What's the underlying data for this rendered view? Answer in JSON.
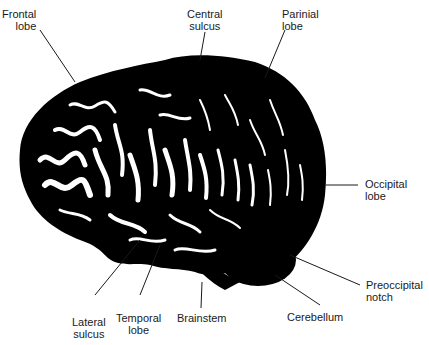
{
  "diagram": {
    "type": "labeled anatomical illustration",
    "labels": [
      {
        "id": "frontal-lobe",
        "line1": "Frontal",
        "line2": "lobe"
      },
      {
        "id": "central-sulcus",
        "line1": "Central",
        "line2": "sulcus"
      },
      {
        "id": "parinial-lobe",
        "line1": "Parinial",
        "line2": "lobe"
      },
      {
        "id": "occipital-lobe",
        "line1": "Occipital",
        "line2": "lobe"
      },
      {
        "id": "preoccipital-notch",
        "line1": "Preoccipital",
        "line2": "notch"
      },
      {
        "id": "cerebellum",
        "line1": "Cerebellum",
        "line2": ""
      },
      {
        "id": "brainstem",
        "line1": "Brainstem",
        "line2": ""
      },
      {
        "id": "temporal-lobe",
        "line1": "Temporal",
        "line2": "lobe"
      },
      {
        "id": "lateral-sulcus",
        "line1": "Lateral",
        "line2": "sulcus"
      }
    ],
    "colors": {
      "ink": "#000000",
      "background": "#ffffff",
      "text": "#1a1a1a"
    }
  }
}
